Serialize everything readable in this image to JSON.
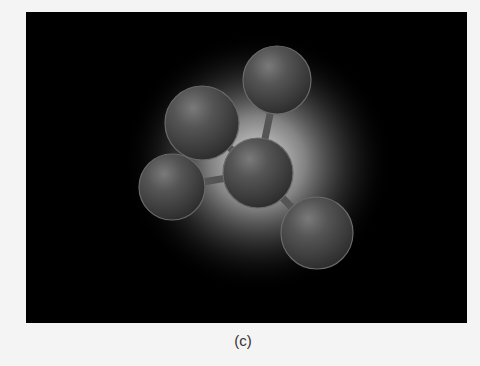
{
  "figure": {
    "caption": "(c)",
    "background_color": "#000000",
    "glow_color": "#d8d8d8",
    "sphere_color": "#4a4a4a",
    "atoms": [
      {
        "id": "top",
        "cx": 251,
        "cy": 68,
        "r": 34
      },
      {
        "id": "upper-left",
        "cx": 176,
        "cy": 111,
        "r": 37
      },
      {
        "id": "left",
        "cx": 146,
        "cy": 175,
        "r": 33
      },
      {
        "id": "center",
        "cx": 232,
        "cy": 161,
        "r": 35
      },
      {
        "id": "bottom-right",
        "cx": 291,
        "cy": 221,
        "r": 36
      }
    ],
    "bonds": [
      {
        "from": "center",
        "to": "top"
      },
      {
        "from": "center",
        "to": "upper-left"
      },
      {
        "from": "center",
        "to": "left"
      },
      {
        "from": "center",
        "to": "bottom-right"
      }
    ]
  }
}
